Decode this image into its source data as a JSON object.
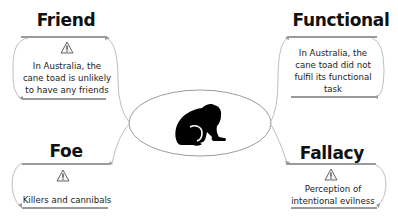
{
  "diagram": {
    "center": {
      "icon": "toad-silhouette-icon",
      "shape": "ellipse"
    },
    "nodes": [
      {
        "id": "friend",
        "title": "Friend",
        "icon": "warning-icon",
        "text_lines": [
          "In Australia, the",
          "cane toad is unlikely",
          "to have any friends"
        ]
      },
      {
        "id": "functional",
        "title": "Functional",
        "icon": "warning-icon",
        "text_lines": [
          "In Australia, the",
          "cane toad did not",
          "fulfil its functional",
          "task"
        ]
      },
      {
        "id": "foe",
        "title": "Foe",
        "icon": "warning-icon",
        "text_lines": [
          "Killers and cannibals"
        ]
      },
      {
        "id": "fallacy",
        "title": "Fallacy",
        "icon": "warning-icon",
        "text_lines": [
          "Perception of",
          "intentional evilness"
        ]
      }
    ],
    "colors": {
      "line": "#b8b8b8",
      "divider": "#9a9a9a",
      "ellipse": "#9c9c9c",
      "text": "#222222",
      "title": "#111111",
      "toad": "#000000"
    }
  }
}
